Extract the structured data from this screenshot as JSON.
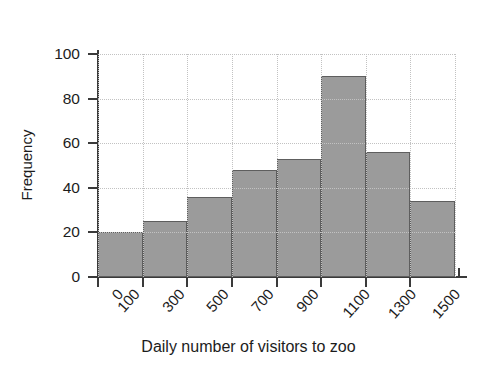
{
  "chart_data": {
    "type": "bar",
    "title": "",
    "subtitle": "",
    "xlabel": "Daily number of visitors to zoo",
    "ylabel": "Frequency",
    "categories": [
      "100-300",
      "300-500",
      "500-700",
      "700-900",
      "900-1100",
      "1100-1300",
      "1300-1500",
      "1500-1700"
    ],
    "values": [
      20,
      25,
      36,
      48,
      53,
      90,
      56,
      34
    ],
    "bin_edges": [
      100,
      300,
      500,
      700,
      900,
      1100,
      1300,
      1500,
      1700
    ],
    "x_tick_labels": [
      "0",
      "100",
      "300",
      "500",
      "700",
      "900",
      "1100",
      "1300",
      "1500"
    ],
    "y_tick_labels": [
      "0",
      "20",
      "40",
      "60",
      "80",
      "100"
    ],
    "y_ticks": [
      0,
      20,
      40,
      60,
      80,
      100
    ],
    "ylim": [
      0,
      100
    ],
    "grid": true,
    "grid_style": "dotted",
    "legend": "none",
    "bar_color": "#9b9b9b",
    "bar_edge_color": "#5e5e5e",
    "axis_color": "#3a3a3a",
    "grid_color": "#c2c2c2",
    "annotations": []
  }
}
